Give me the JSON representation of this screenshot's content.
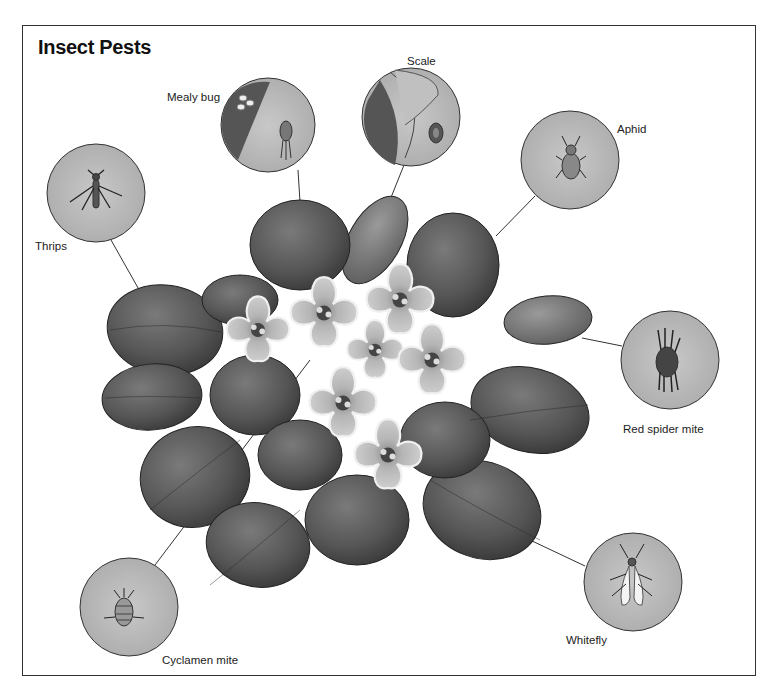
{
  "figure": {
    "title": "Insect Pests",
    "colors": {
      "frame": "#333333",
      "leaf_dark": "#4a4a4a",
      "leaf_mid": "#6b6b6b",
      "flower": "#c9c9c9",
      "flower_edge": "#eeeeee",
      "callout_fill": "#bdbdbd",
      "leader_line": "#333333"
    }
  },
  "callouts": [
    {
      "id": "mealy-bug",
      "label": "Mealy bug",
      "cx": 268,
      "cy": 125,
      "r": 47,
      "label_x": 167,
      "label_y": 91
    },
    {
      "id": "scale",
      "label": "Scale",
      "cx": 411,
      "cy": 117,
      "r": 49,
      "label_x": 407,
      "label_y": 55
    },
    {
      "id": "aphid",
      "label": "Aphid",
      "cx": 570,
      "cy": 160,
      "r": 49,
      "label_x": 617,
      "label_y": 123
    },
    {
      "id": "thrips",
      "label": "Thrips",
      "cx": 96,
      "cy": 193,
      "r": 49,
      "label_x": 35,
      "label_y": 240
    },
    {
      "id": "red-spider-mite",
      "label": "Red spider mite",
      "cx": 670,
      "cy": 360,
      "r": 49,
      "label_x": 623,
      "label_y": 423
    },
    {
      "id": "whitefly",
      "label": "Whitefly",
      "cx": 633,
      "cy": 582,
      "r": 49,
      "label_x": 566,
      "label_y": 634
    },
    {
      "id": "cyclamen-mite",
      "label": "Cyclamen mite",
      "cx": 129,
      "cy": 607,
      "r": 49,
      "label_x": 162,
      "label_y": 654
    }
  ]
}
